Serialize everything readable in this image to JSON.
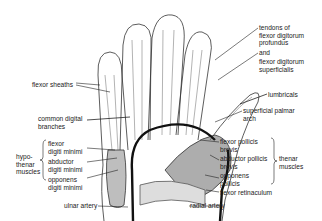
{
  "diagram": {
    "labels": {
      "tendons_fdp_1": "tendons of",
      "tendons_fdp_2": "flexor digitorum",
      "tendons_fdp_3": "profundus",
      "and": "and",
      "fds_1": "flexor digitorum",
      "fds_2": "superficialis",
      "flexor_sheaths": "flexor sheaths",
      "lumbricals": "lumbricals",
      "superficial_palmar_1": "superficial palmar",
      "superficial_palmar_2": "arch",
      "common_digital_1": "common digital",
      "common_digital_2": "branches",
      "fdm_1": "flexor",
      "fdm_2": "digiti minimi",
      "adm_1": "abductor",
      "adm_2": "digiti minimi",
      "odm_1": "opponens",
      "odm_2": "digiti minimi",
      "hypothenar_1": "hypo-",
      "hypothenar_2": "thenar",
      "hypothenar_3": "muscles",
      "fpb_1": "flexor pollicis",
      "fpb_2": "brevis",
      "apb_1": "abductor pollicis",
      "apb_2": "brevis",
      "op_1": "opponens",
      "op_2": "pollicis",
      "thenar_1": "thenar",
      "thenar_2": "muscles",
      "flexor_retinaculum": "flexor retinaculum",
      "ulnar_artery": "ulnar artery",
      "radial_artery": "radial artery"
    }
  }
}
